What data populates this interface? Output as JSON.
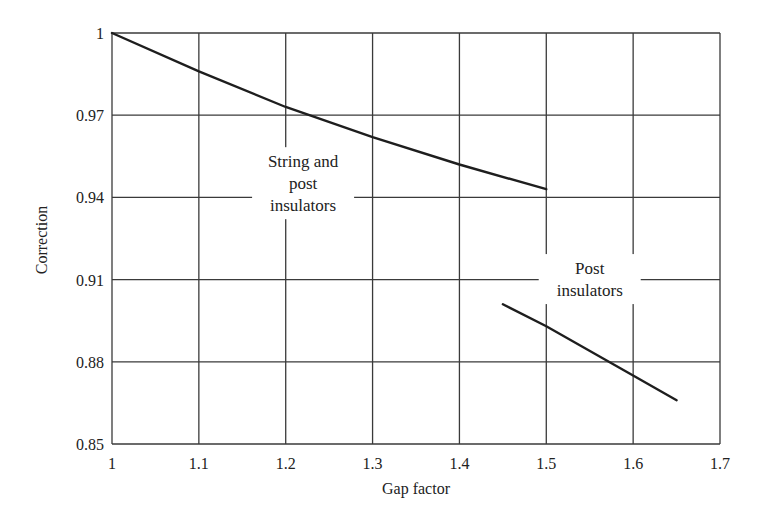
{
  "chart_data": {
    "type": "line",
    "title": "",
    "xlabel": "Gap factor",
    "ylabel": "Correction",
    "xlim": [
      1.0,
      1.7
    ],
    "ylim": [
      0.85,
      1.0
    ],
    "grid": true,
    "legend": null,
    "x_ticks": [
      1,
      1.1,
      1.2,
      1.3,
      1.4,
      1.5,
      1.6,
      1.7
    ],
    "x_tick_labels": [
      "1",
      "1.1",
      "1.2",
      "1.3",
      "1.4",
      "1.5",
      "1.6",
      "1.7"
    ],
    "y_ticks": [
      0.85,
      0.88,
      0.91,
      0.94,
      0.97,
      1.0
    ],
    "y_tick_labels": [
      "0.85",
      "0.88",
      "0.91",
      "0.94",
      "0.97",
      "1"
    ],
    "series": [
      {
        "name": "String and post insulators",
        "x": [
          1.0,
          1.1,
          1.2,
          1.3,
          1.4,
          1.5
        ],
        "y": [
          1.0,
          0.986,
          0.973,
          0.962,
          0.952,
          0.943
        ]
      },
      {
        "name": "Post insulators",
        "x": [
          1.45,
          1.5,
          1.6,
          1.65
        ],
        "y": [
          0.901,
          0.893,
          0.875,
          0.866
        ]
      }
    ],
    "annotations": [
      {
        "lines": [
          "String and",
          "post",
          "insulators"
        ],
        "x": 1.22,
        "y": 0.943
      },
      {
        "lines": [
          "Post",
          "insulators"
        ],
        "x": 1.55,
        "y": 0.908
      }
    ]
  }
}
